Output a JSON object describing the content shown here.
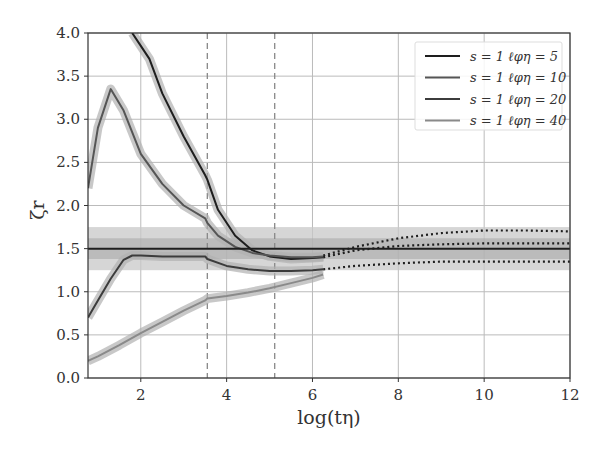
{
  "chart_data": {
    "type": "line",
    "title": "",
    "xlabel": "log(tη)",
    "ylabel": "ζ_r",
    "xlim": [
      0.77,
      12
    ],
    "ylim": [
      0,
      4
    ],
    "xticks": [
      "2",
      "4",
      "6",
      "8",
      "10",
      "12"
    ],
    "xtick_values": [
      2,
      4,
      6,
      8,
      10,
      12
    ],
    "yticks": [
      "0.0",
      "0.5",
      "1.0",
      "1.5",
      "2.0",
      "2.5",
      "3.0",
      "3.5",
      "4.0"
    ],
    "ytick_values": [
      0,
      0.5,
      1.0,
      1.5,
      2.0,
      2.5,
      3.0,
      3.5,
      4.0
    ],
    "grid": true,
    "legend_position": "upper right",
    "vertical_dashed_lines": [
      3.55,
      5.12
    ],
    "reference_line": {
      "y": 1.5,
      "band_inner": [
        1.38,
        1.62
      ],
      "band_outer": [
        1.25,
        1.75
      ]
    },
    "series": [
      {
        "name": "s = 1 ℓ_φη = 5",
        "color": "#1e1e1e",
        "x": [
          1.8,
          2.0,
          2.2,
          2.5,
          3.0,
          3.5,
          3.55,
          3.8,
          4.2,
          4.6,
          5.0,
          5.5,
          6.0,
          6.25
        ],
        "y": [
          4.0,
          3.85,
          3.7,
          3.3,
          2.8,
          2.35,
          2.3,
          1.95,
          1.65,
          1.48,
          1.41,
          1.38,
          1.39,
          1.4
        ]
      },
      {
        "name": "s = 1 ℓ_φη = 10",
        "color": "#555555",
        "x": [
          0.77,
          1.0,
          1.3,
          1.6,
          2.0,
          2.5,
          3.0,
          3.5,
          3.55,
          3.8,
          4.2,
          4.6,
          5.0,
          5.5,
          6.0,
          6.25
        ],
        "y": [
          2.2,
          2.9,
          3.35,
          3.1,
          2.6,
          2.25,
          2.0,
          1.85,
          1.8,
          1.65,
          1.52,
          1.45,
          1.42,
          1.4,
          1.4,
          1.41
        ]
      },
      {
        "name": "s = 1 ℓ_φη = 20",
        "color": "#3c3c3c",
        "x": [
          0.77,
          1.0,
          1.3,
          1.6,
          1.8,
          2.0,
          2.5,
          3.0,
          3.5,
          3.55,
          4.0,
          4.5,
          5.0,
          5.5,
          6.0,
          6.25
        ],
        "y": [
          0.7,
          0.9,
          1.15,
          1.37,
          1.42,
          1.42,
          1.41,
          1.41,
          1.41,
          1.38,
          1.3,
          1.26,
          1.24,
          1.24,
          1.25,
          1.26
        ]
      },
      {
        "name": "s = 1 ℓ_φη = 40",
        "color": "#8a8a8a",
        "x": [
          0.77,
          1.0,
          1.5,
          2.0,
          2.5,
          3.0,
          3.5,
          3.55,
          4.0,
          4.5,
          5.0,
          5.5,
          6.0,
          6.25
        ],
        "y": [
          0.2,
          0.25,
          0.38,
          0.52,
          0.65,
          0.78,
          0.9,
          0.92,
          0.95,
          0.99,
          1.04,
          1.1,
          1.16,
          1.2
        ]
      }
    ],
    "dotted_extrapolations": [
      {
        "x": [
          6.25,
          7.0,
          8.0,
          9.0,
          10.0,
          11.0,
          12.0
        ],
        "y": [
          1.42,
          1.52,
          1.62,
          1.68,
          1.71,
          1.71,
          1.7
        ]
      },
      {
        "x": [
          6.25,
          7.0,
          8.0,
          9.0,
          10.0,
          11.0,
          12.0
        ],
        "y": [
          1.4,
          1.48,
          1.53,
          1.55,
          1.56,
          1.56,
          1.56
        ]
      },
      {
        "x": [
          6.25,
          7.0,
          8.0,
          9.0,
          10.0,
          11.0,
          12.0
        ],
        "y": [
          1.26,
          1.3,
          1.33,
          1.35,
          1.35,
          1.35,
          1.35
        ]
      }
    ]
  },
  "legend": {
    "items": [
      {
        "label": "s = 1 ℓφη = 5",
        "color": "#1e1e1e"
      },
      {
        "label": "s = 1 ℓφη = 10",
        "color": "#555555"
      },
      {
        "label": "s = 1 ℓφη = 20",
        "color": "#3c3c3c"
      },
      {
        "label": "s = 1 ℓφη = 40",
        "color": "#8a8a8a"
      }
    ]
  },
  "axes": {
    "xlabel": "log(tη)",
    "ylabel": "ζr"
  }
}
